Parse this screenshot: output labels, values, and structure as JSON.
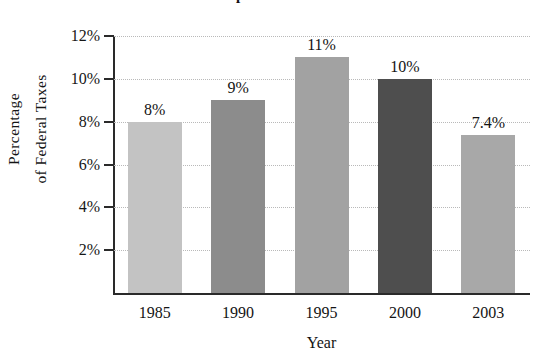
{
  "chart_data": {
    "type": "bar",
    "title": "Total Corporate Income Taxes",
    "xlabel": "Year",
    "ylabel": "Percentage of Federal Taxes",
    "ylabel_lines": [
      "Percentage",
      "of Federal Taxes"
    ],
    "categories": [
      "1985",
      "1990",
      "1995",
      "2000",
      "2003"
    ],
    "values": [
      8,
      9,
      11,
      10,
      7.4
    ],
    "value_labels": [
      "8%",
      "9%",
      "11%",
      "10%",
      "7.4%"
    ],
    "ylim": [
      0,
      12
    ],
    "yticks": [
      12,
      10,
      8,
      6,
      4,
      2
    ],
    "ytick_labels": [
      "12%",
      "10%",
      "8%",
      "6%",
      "4%",
      "2%"
    ],
    "grid": true,
    "grid_color": "#b9b9b9",
    "legend": "none",
    "bar_colors": [
      "#c3c3c3",
      "#8c8c8c",
      "#a2a2a2",
      "#4e4e4e",
      "#a8a8a8"
    ],
    "axis_color": "#2a2a2a"
  }
}
